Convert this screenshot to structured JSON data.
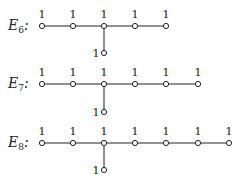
{
  "diagrams": [
    {
      "name": "E",
      "subscript": "6",
      "colon": ":",
      "row_labels": [
        "1",
        "1",
        "1",
        "1",
        "1"
      ],
      "branch_label": "1",
      "branch_index": 2
    },
    {
      "name": "E",
      "subscript": "7",
      "colon": ":",
      "row_labels": [
        "1",
        "1",
        "1",
        "1",
        "1",
        "1"
      ],
      "branch_label": "1",
      "branch_index": 2
    },
    {
      "name": "E",
      "subscript": "8",
      "colon": ":",
      "row_labels": [
        "1",
        "1",
        "1",
        "1",
        "1",
        "1",
        "1"
      ],
      "branch_label": "1",
      "branch_index": 2
    }
  ],
  "colors": {
    "ink": "#222222",
    "background": "#ffffff"
  }
}
